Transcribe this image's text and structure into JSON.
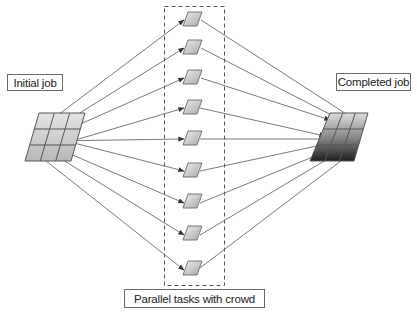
{
  "diagram": {
    "labels": {
      "initial_job": "Initial job",
      "completed_job": "Completed job",
      "parallel_tasks": "Parallel tasks with crowd"
    },
    "nodes": {
      "initial_job_grid": {
        "rows": 3,
        "cols": 3,
        "style": "light-gray-gradient"
      },
      "completed_job_grid": {
        "rows": 3,
        "cols": 3,
        "style": "dark-gradient"
      },
      "parallel_tasks": {
        "count": 9,
        "container": "dashed-box"
      }
    },
    "edges": {
      "from_initial_to_tasks": 9,
      "from_tasks_to_completed": 9,
      "arrowheads": "at-target"
    },
    "colors": {
      "line": "#6b6b6b",
      "task_fill_light": "#e6e6e6",
      "task_fill_dark": "#a9a9a9",
      "completed_fill_dark": "#2a2a2a",
      "completed_fill_light": "#d8d8d8"
    }
  }
}
